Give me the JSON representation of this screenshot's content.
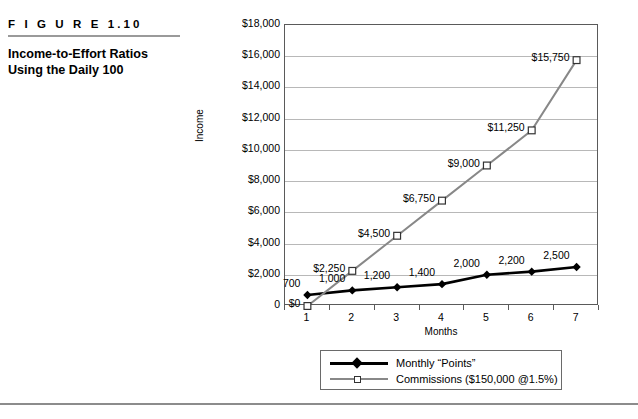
{
  "figure": {
    "number": "F I G U R E    1.10",
    "title_line1": "Income-to-Effort Ratios",
    "title_line2": "Using the Daily 100"
  },
  "colors": {
    "points_series": "#000000",
    "commissions_series": "#888888",
    "gridline": "#b8b8b8",
    "axis": "#5a5a5a",
    "divider": "#9a9a9a"
  },
  "legend": {
    "position": "bottom",
    "items": [
      {
        "label": "Monthly “Points”",
        "marker": "filled-diamond",
        "color": "#000000"
      },
      {
        "label": "Commissions ($150,000 @1.5%)",
        "marker": "open-square",
        "color": "#888888"
      }
    ]
  },
  "chart_data": {
    "type": "line",
    "title": "",
    "xlabel": "Months",
    "ylabel": "Income",
    "categories": [
      "1",
      "2",
      "3",
      "4",
      "5",
      "6",
      "7"
    ],
    "ylim": [
      0,
      18000
    ],
    "ytick_values": [
      0,
      2000,
      4000,
      6000,
      8000,
      10000,
      12000,
      14000,
      16000,
      18000
    ],
    "ytick_labels": [
      "0",
      "$2,000",
      "$4,000",
      "$6,000",
      "$8,000",
      "$10,000",
      "$12,000",
      "$14,000",
      "$16,000",
      "$18,000"
    ],
    "grid": true,
    "series": [
      {
        "name": "Monthly “Points”",
        "marker": "filled-diamond",
        "color": "#000000",
        "values": [
          700,
          1000,
          1200,
          1400,
          2000,
          2200,
          2500
        ],
        "data_labels": [
          "700",
          "1,000",
          "1,200",
          "1,400",
          "2,000",
          "2,200",
          "2,500"
        ]
      },
      {
        "name": "Commissions ($150,000 @1.5%)",
        "marker": "open-square",
        "color": "#888888",
        "values": [
          0,
          2250,
          4500,
          6750,
          9000,
          11250,
          15750
        ],
        "data_labels": [
          "$0",
          "$2,250",
          "$4,500",
          "$6,750",
          "$9,000",
          "$11,250",
          "$15,750"
        ]
      }
    ]
  }
}
